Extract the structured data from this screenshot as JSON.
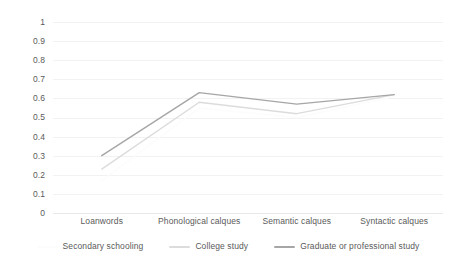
{
  "chart_data": {
    "type": "line",
    "title": "",
    "subtitle": "",
    "xlabel": "",
    "ylabel": "",
    "ylim": [
      0,
      1
    ],
    "grid": true,
    "legend_position": "bottom",
    "categories": [
      "Loanwords",
      "Phonological calques",
      "Semantic calques",
      "Syntactic calques"
    ],
    "yticks": [
      "1",
      "0.9",
      "0.8",
      "0.7",
      "0.6",
      "0.5",
      "0.4",
      "0.3",
      "0.2",
      "0.1",
      "0"
    ],
    "ytick_values": [
      1,
      0.9,
      0.8,
      0.7,
      0.6,
      0.5,
      0.4,
      0.3,
      0.2,
      0.1,
      0
    ],
    "series": [
      {
        "name": "Secondary schooling",
        "color": "#fcfcfc",
        "values": [
          0.17,
          0.55,
          0.5,
          0.61
        ]
      },
      {
        "name": "College study",
        "color": "#dcdcdc",
        "values": [
          0.23,
          0.58,
          0.52,
          0.62
        ]
      },
      {
        "name": "Graduate or professional study",
        "color": "#a6a6a6",
        "values": [
          0.3,
          0.63,
          0.57,
          0.62
        ]
      }
    ]
  },
  "legend": {
    "items": [
      {
        "label": "Secondary schooling"
      },
      {
        "label": "College study"
      },
      {
        "label": "Graduate or professional study"
      }
    ]
  },
  "colors": {
    "gridline": "#f2f2f2",
    "axis_text": "#5a5a5a",
    "background": "#ffffff",
    "series_secondary": "#fcfcfc",
    "series_college": "#dcdcdc",
    "series_graduate": "#a6a6a6"
  }
}
